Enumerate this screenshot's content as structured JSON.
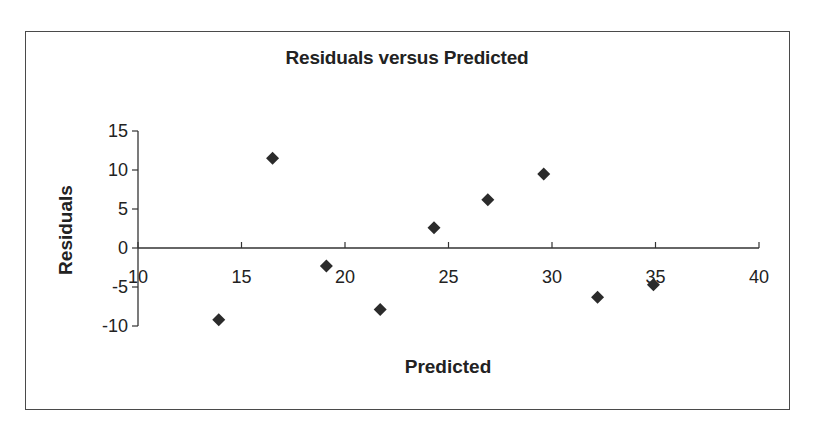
{
  "chart": {
    "title": "Residuals versus Predicted",
    "xlabel": "Predicted",
    "ylabel": "Residuals",
    "marker_color": "#2b2b2b",
    "axis_color": "#333333"
  },
  "chart_data": {
    "type": "scatter",
    "title": "Residuals versus Predicted",
    "xlabel": "Predicted",
    "ylabel": "Residuals",
    "xlim": [
      10,
      40
    ],
    "ylim": [
      -10,
      15
    ],
    "x_ticks": [
      10,
      15,
      20,
      25,
      30,
      35,
      40
    ],
    "y_ticks": [
      -10,
      -5,
      0,
      5,
      10,
      15
    ],
    "x_tick_labels": [
      "10",
      "15",
      "20",
      "25",
      "30",
      "35",
      "40"
    ],
    "y_tick_labels": [
      "-10",
      "-5",
      "0",
      "5",
      "10",
      "15"
    ],
    "grid": false,
    "legend": null,
    "marker": "diamond",
    "series": [
      {
        "name": "Residuals",
        "x": [
          13.9,
          16.5,
          19.1,
          21.7,
          24.3,
          26.9,
          29.6,
          32.2,
          34.9
        ],
        "y": [
          -9.2,
          11.5,
          -2.3,
          -7.9,
          2.6,
          6.2,
          9.5,
          -6.3,
          -4.7
        ]
      }
    ]
  }
}
